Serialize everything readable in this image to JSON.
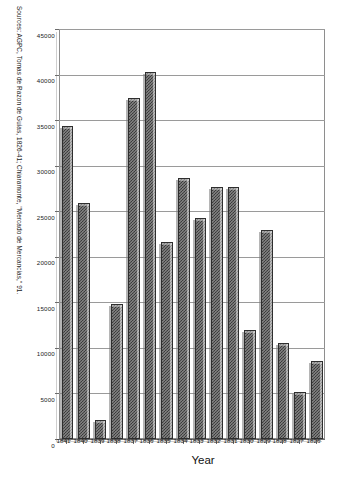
{
  "chart_data": {
    "type": "bar",
    "orientation": "vertical-rotated-90",
    "title": "",
    "xlabel": "Year",
    "ylabel": "",
    "ylim": [
      0,
      45000
    ],
    "grid": true,
    "legend": "none",
    "categories": [
      "1826",
      "1827",
      "1828",
      "1829",
      "1830",
      "1831",
      "1832",
      "1833",
      "1834",
      "1835",
      "1836",
      "1837",
      "1838",
      "1839",
      "1840",
      "1841"
    ],
    "values": [
      8600,
      5200,
      10500,
      22900,
      12000,
      27700,
      27700,
      24300,
      28700,
      21600,
      40300,
      37400,
      14800,
      2100,
      25900,
      34400
    ],
    "ytick_labels": [
      "0",
      "5000",
      "10000",
      "15000",
      "20000",
      "25000",
      "30000",
      "35000",
      "40000",
      "45000"
    ],
    "ytick_values": [
      0,
      5000,
      10000,
      15000,
      20000,
      25000,
      30000,
      35000,
      40000,
      45000
    ],
    "annotations": {
      "source": "Sources: AGPC, Tomas de Razon de Guias, 1826-41; Chiaramonte, \"Mercado de Mercancias,\" 91."
    },
    "colors": {
      "bar_fill": "#4a4a4a",
      "bar_edge": "#2e2e2e",
      "grid": "#9a9a9a",
      "axis": "#6b6b6b",
      "background": "#ffffff",
      "text": "#1a1a1a"
    }
  }
}
